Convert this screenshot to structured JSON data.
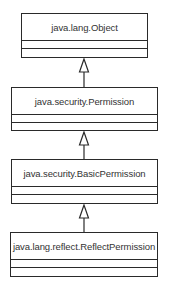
{
  "diagram": {
    "type": "uml-class-hierarchy",
    "classes": [
      {
        "name": "java.lang.Object"
      },
      {
        "name": "java.security.Permission"
      },
      {
        "name": "java.security.BasicPermission"
      },
      {
        "name": "java.lang.reflect.ReflectPermission"
      }
    ],
    "relations": [
      {
        "from": "java.security.Permission",
        "to": "java.lang.Object",
        "kind": "generalization"
      },
      {
        "from": "java.security.BasicPermission",
        "to": "java.security.Permission",
        "kind": "generalization"
      },
      {
        "from": "java.lang.reflect.ReflectPermission",
        "to": "java.security.BasicPermission",
        "kind": "generalization"
      }
    ],
    "colors": {
      "line": "#2a2a2a",
      "text": "#333333",
      "background": "#ffffff"
    }
  }
}
